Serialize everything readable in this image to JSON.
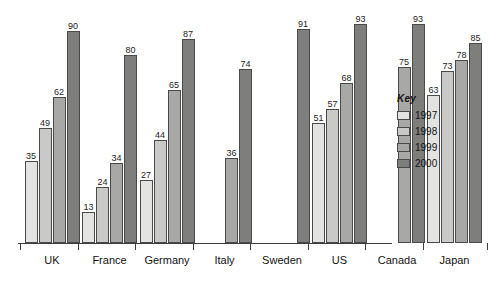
{
  "chart_data": {
    "type": "bar",
    "title": "",
    "subtitle": "",
    "xlabel": "",
    "ylabel": "",
    "ylim": [
      0,
      100
    ],
    "grid": false,
    "legend_position": "right",
    "legend_title": "Key",
    "categories": [
      "UK",
      "France",
      "Germany",
      "Italy",
      "Sweden",
      "US",
      "Canada",
      "Japan"
    ],
    "series": [
      {
        "name": "1997",
        "color": "#e3e3e1",
        "values": [
          35,
          13,
          27,
          null,
          null,
          51,
          null,
          63
        ]
      },
      {
        "name": "1998",
        "color": "#c9c9c7",
        "values": [
          49,
          24,
          44,
          null,
          null,
          57,
          null,
          73
        ]
      },
      {
        "name": "1999",
        "color": "#a8a8a6",
        "values": [
          62,
          34,
          65,
          36,
          null,
          68,
          75,
          78
        ]
      },
      {
        "name": "2000",
        "color": "#7e7e7c",
        "values": [
          90,
          80,
          87,
          74,
          91,
          93,
          93,
          85
        ]
      }
    ]
  },
  "legend": {
    "title": "Key",
    "entries": [
      {
        "label": "1997",
        "color": "#e3e3e1"
      },
      {
        "label": "1998",
        "color": "#c9c9c7"
      },
      {
        "label": "1999",
        "color": "#a8a8a6"
      },
      {
        "label": "2000",
        "color": "#7e7e7c"
      }
    ]
  },
  "axis": {
    "baseline_color": "#3d3d3d",
    "tick_color": "#3d3d3d"
  }
}
